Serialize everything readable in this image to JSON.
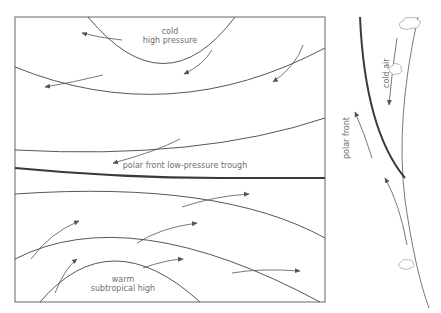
{
  "main_panel": {
    "labels": {
      "cold_high_line1": "cold",
      "cold_high_line2": "high pressure",
      "polar_front_trough": "polar front low-pressure trough",
      "warm_high_line1": "warm",
      "warm_high_line2": "subtropical high"
    }
  },
  "side_panel": {
    "labels": {
      "cold_air": "cold air",
      "polar_front": "polar front"
    }
  },
  "colors": {
    "line": "#3a3a3a",
    "thin_line": "#555555",
    "text": "#6f6f6f",
    "background": "#ffffff"
  }
}
